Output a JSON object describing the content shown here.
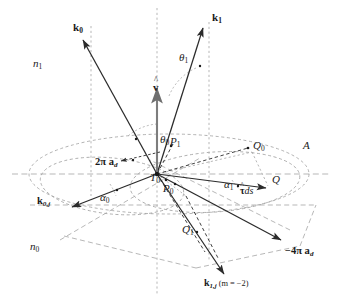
{
  "figure": {
    "width": 340,
    "height": 304,
    "background": "#ffffff",
    "stroke_solid": "#2b2b2b",
    "stroke_dashed": "#9a9a9a",
    "stroke_gray_arrow": "#808080",
    "text_color": "#1a1a1a"
  },
  "labels": {
    "k0": {
      "base": "k",
      "sub": "0"
    },
    "k1": {
      "base": "k",
      "sub": "1"
    },
    "k0j": {
      "base": "k",
      "sub": "0,j"
    },
    "k1j": {
      "base": "k",
      "sub": "1,j",
      "note": "(m = −2)"
    },
    "n1": {
      "base": "n",
      "sub": "1"
    },
    "n0": {
      "base": "n",
      "sub": "0"
    },
    "theta0": {
      "base": "θ",
      "sub": "0"
    },
    "theta1": {
      "base": "θ",
      "sub": "1"
    },
    "alpha0": {
      "base": "α",
      "sub": "0"
    },
    "alpha1": {
      "base": "α",
      "sub": "1"
    },
    "vhat": {
      "base": "v"
    },
    "tau_ds": {
      "base": "τ",
      "suffix": "ds"
    },
    "P0": {
      "base": "P",
      "sub": "0"
    },
    "P1": {
      "base": "P",
      "sub": "1"
    },
    "T0": {
      "base": "T",
      "sub": "0"
    },
    "Q": {
      "base": "Q"
    },
    "Q0": {
      "base": "Q",
      "sub": "0"
    },
    "Q1": {
      "base": "Q",
      "sub": "1"
    },
    "A": {
      "base": "A"
    },
    "two_pi_ad": {
      "base": "2π a",
      "sub": "d"
    },
    "minus_four_pi_ad": {
      "base": "−4π a",
      "sub": "d"
    }
  }
}
